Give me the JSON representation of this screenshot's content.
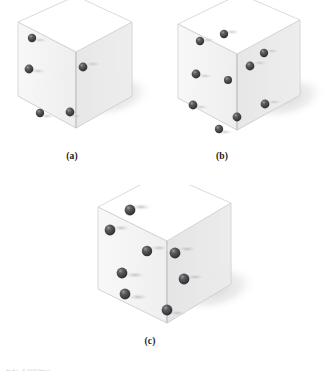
{
  "figure": {
    "background_color": "#ffffff",
    "sphere_color": "#3a3a3c",
    "sphere_highlight_color": "#8e8e92",
    "box_edge_color": "#c9c9c9",
    "box_face_color": "#f2f2f2",
    "shadow_color": "#dcdcdc",
    "panels": [
      {
        "id": "a",
        "label": "(a)",
        "sphere_count": 4,
        "spheres": [
          {
            "x": 32,
            "y": 38,
            "r": 4.2,
            "face": "left-wall-upper"
          },
          {
            "x": 29,
            "y": 69,
            "r": 4.4,
            "face": "left-wall-middle"
          },
          {
            "x": 83,
            "y": 67,
            "r": 4.4,
            "face": "right-wall-upper"
          },
          {
            "x": 40,
            "y": 113,
            "r": 4.2,
            "face": "floor-left"
          },
          {
            "x": 70,
            "y": 112,
            "r": 4.4,
            "face": "floor-center"
          }
        ]
      },
      {
        "id": "b",
        "label": "(b)",
        "sphere_count": 8,
        "spheres": [
          {
            "x": 64,
            "y": 34,
            "r": 4.2,
            "face": "top-edge-right"
          },
          {
            "x": 40,
            "y": 41,
            "r": 4.2,
            "face": "top-edge-left"
          },
          {
            "x": 104,
            "y": 53,
            "r": 4.2,
            "face": "right-wall-upper"
          },
          {
            "x": 90,
            "y": 66,
            "r": 4.4,
            "face": "right-wall-middle"
          },
          {
            "x": 36,
            "y": 74,
            "r": 4.4,
            "face": "left-wall-upper"
          },
          {
            "x": 68,
            "y": 80,
            "r": 4.0,
            "face": "center-column"
          },
          {
            "x": 33,
            "y": 105,
            "r": 4.4,
            "face": "left-wall-lower"
          },
          {
            "x": 105,
            "y": 104,
            "r": 4.4,
            "face": "right-wall-lower"
          },
          {
            "x": 77,
            "y": 117,
            "r": 4.4,
            "face": "vertical-edge-lower"
          },
          {
            "x": 59,
            "y": 129,
            "r": 4.2,
            "face": "floor-left"
          }
        ]
      },
      {
        "id": "c",
        "label": "(c)",
        "sphere_count": 8,
        "spheres": [
          {
            "x": 45,
            "y": 25,
            "r": 5.4,
            "face": "top-face-center"
          },
          {
            "x": 25,
            "y": 45,
            "r": 5.4,
            "face": "left-wall-top"
          },
          {
            "x": 62,
            "y": 66,
            "r": 5.2,
            "face": "center-edge"
          },
          {
            "x": 90,
            "y": 68,
            "r": 5.4,
            "face": "right-wall-upper"
          },
          {
            "x": 37,
            "y": 88,
            "r": 5.4,
            "face": "left-wall-middle"
          },
          {
            "x": 99,
            "y": 94,
            "r": 5.4,
            "face": "right-wall-lower"
          },
          {
            "x": 40,
            "y": 109,
            "r": 5.4,
            "face": "left-wall-lower"
          },
          {
            "x": 82,
            "y": 125,
            "r": 5.4,
            "face": "floor-center"
          }
        ]
      }
    ]
  },
  "footer": {
    "clipped_caption": "21. Third..."
  }
}
